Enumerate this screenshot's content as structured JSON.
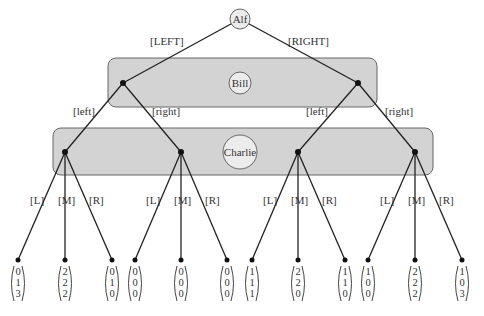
{
  "diagram": {
    "type": "extensive-form game tree",
    "players": {
      "root": "Alf",
      "level2": "Bill",
      "level3": "Charlie"
    },
    "actions": {
      "alf": [
        "[LEFT]",
        "[RIGHT]"
      ],
      "bill": [
        "[left]",
        "[right]",
        "[left]",
        "[right]"
      ],
      "charlie": [
        [
          "[L]",
          "[M]",
          "[R]"
        ],
        [
          "[L]",
          "[M]",
          "[R]"
        ],
        [
          "[L]",
          "[M]",
          "[R]"
        ],
        [
          "[L]",
          "[M]",
          "[R]"
        ]
      ]
    },
    "payoffs": [
      [
        "0",
        "1",
        "3"
      ],
      [
        "2",
        "2",
        "2"
      ],
      [
        "0",
        "1",
        "0"
      ],
      [
        "0",
        "0",
        "0"
      ],
      [
        "0",
        "0",
        "0"
      ],
      [
        "0",
        "0",
        "0"
      ],
      [
        "1",
        "1",
        "1"
      ],
      [
        "2",
        "2",
        "0"
      ],
      [
        "1",
        "1",
        "0"
      ],
      [
        "1",
        "0",
        "0"
      ],
      [
        "2",
        "2",
        "2"
      ],
      [
        "1",
        "0",
        "3"
      ]
    ],
    "colors": {
      "infoset_fill": "#d3d3d3",
      "infoset_stroke": "#666666",
      "player_circle_fill": "#ececec",
      "edge": "#222222"
    }
  }
}
